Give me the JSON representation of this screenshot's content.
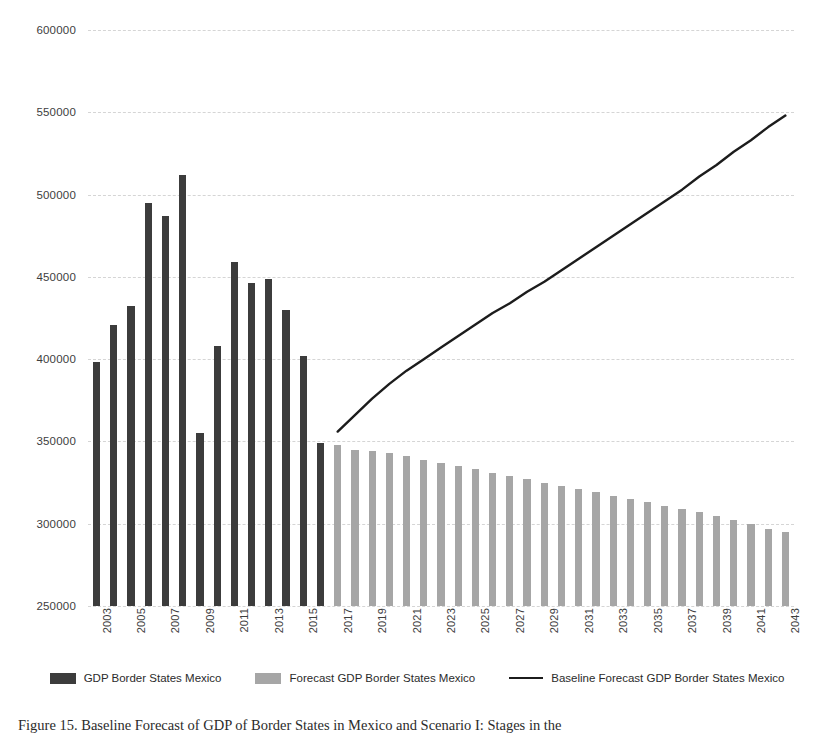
{
  "chart_data": {
    "type": "bar",
    "title": "",
    "xlabel": "",
    "ylabel": "",
    "ylim": [
      250000,
      600000
    ],
    "ytick_step": 50000,
    "yticks": [
      "250000",
      "300000",
      "350000",
      "400000",
      "450000",
      "500000",
      "550000",
      "600000"
    ],
    "grid": true,
    "legend_position": "bottom",
    "x_start_year": 2003,
    "x_end_year": 2043,
    "xticks": [
      "2003",
      "2005",
      "2007",
      "2009",
      "2011",
      "2013",
      "2015",
      "2017",
      "2019",
      "2021",
      "2023",
      "2025",
      "2027",
      "2029",
      "2031",
      "2033",
      "2035",
      "2037",
      "2039",
      "2041",
      "2043"
    ],
    "categories": [
      "2003",
      "2004",
      "2005",
      "2006",
      "2007",
      "2008",
      "2009",
      "2010",
      "2011",
      "2012",
      "2013",
      "2014",
      "2015",
      "2016",
      "2017",
      "2018",
      "2019",
      "2020",
      "2021",
      "2022",
      "2023",
      "2024",
      "2025",
      "2026",
      "2027",
      "2028",
      "2029",
      "2030",
      "2031",
      "2032",
      "2033",
      "2034",
      "2035",
      "2036",
      "2037",
      "2038",
      "2039",
      "2040",
      "2041",
      "2042",
      "2043"
    ],
    "series": [
      {
        "name": "GDP Border States Mexico",
        "type": "bar",
        "color": "#3c3c3c",
        "values": [
          398000,
          421000,
          432000,
          495000,
          487000,
          512000,
          355000,
          408000,
          459000,
          446000,
          449000,
          430000,
          402000,
          349000,
          null,
          null,
          null,
          null,
          null,
          null,
          null,
          null,
          null,
          null,
          null,
          null,
          null,
          null,
          null,
          null,
          null,
          null,
          null,
          null,
          null,
          null,
          null,
          null,
          null,
          null,
          null
        ]
      },
      {
        "name": "Forecast GDP Border States Mexico",
        "type": "bar",
        "color": "#a6a6a6",
        "values": [
          null,
          null,
          null,
          null,
          null,
          null,
          null,
          null,
          null,
          null,
          null,
          null,
          null,
          null,
          348000,
          345000,
          344000,
          343000,
          341000,
          339000,
          337000,
          335000,
          333000,
          331000,
          329000,
          327000,
          325000,
          323000,
          321000,
          319000,
          317000,
          315000,
          313000,
          311000,
          309000,
          307000,
          305000,
          302000,
          300000,
          297000,
          295000
        ]
      },
      {
        "name": "Baseline Forecast GDP Border States Mexico",
        "type": "line",
        "color": "#1c1c1c",
        "values": [
          null,
          null,
          null,
          null,
          null,
          null,
          null,
          null,
          null,
          null,
          null,
          null,
          null,
          null,
          356000,
          366000,
          376000,
          385000,
          393000,
          400000,
          407000,
          414000,
          421000,
          428000,
          434000,
          441000,
          447000,
          454000,
          461000,
          468000,
          475000,
          482000,
          489000,
          496000,
          503000,
          511000,
          518000,
          526000,
          533000,
          541000,
          548000
        ]
      }
    ]
  },
  "legend": {
    "items": [
      {
        "label": "GDP Border States Mexico",
        "marker": "swatch-dark"
      },
      {
        "label": "Forecast GDP Border States Mexico",
        "marker": "swatch-gray"
      },
      {
        "label": "Baseline Forecast GDP Border States Mexico",
        "marker": "line-black"
      }
    ]
  },
  "caption": {
    "text": "Figure 15. Baseline Forecast of GDP of Border States in Mexico and Scenario I: Stages in the"
  }
}
